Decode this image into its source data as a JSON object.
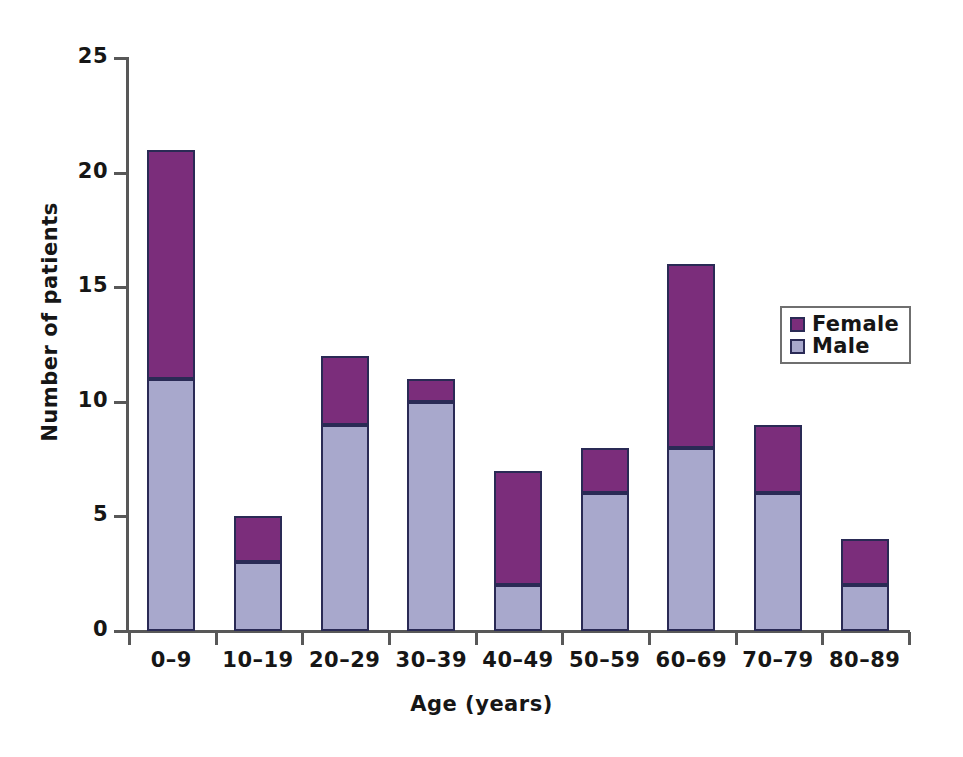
{
  "chart_data": {
    "type": "bar",
    "subtype": "stacked-vertical-bar",
    "title": "",
    "xlabel": "Age (years)",
    "ylabel": "Number of patients",
    "categories": [
      "0–9",
      "10–19",
      "20–29",
      "30–39",
      "40–49",
      "50–59",
      "60–69",
      "70–79",
      "80–89"
    ],
    "series": [
      {
        "name": "Male",
        "color": "#a8a8cc",
        "values": [
          11,
          3,
          9,
          10,
          2,
          6,
          8,
          6,
          2
        ]
      },
      {
        "name": "Female",
        "color": "#7b2d7b",
        "values": [
          10,
          2,
          3,
          1,
          5,
          2,
          8,
          3,
          2
        ]
      }
    ],
    "stack_order_bottom_to_top": [
      "Male",
      "Female"
    ],
    "totals": [
      21,
      5,
      12,
      11,
      7,
      8,
      16,
      9,
      4
    ],
    "ylim": [
      0,
      25
    ],
    "yticks": [
      0,
      5,
      10,
      15,
      20,
      25
    ],
    "ytick_labels": [
      "0",
      "5",
      "10",
      "15",
      "20",
      "25"
    ],
    "grid": false,
    "legend_position": "upper-right-inside"
  },
  "legend": {
    "entries": [
      {
        "label": "Female",
        "color": "#7b2d7b"
      },
      {
        "label": "Male",
        "color": "#a8a8cc"
      }
    ]
  },
  "colors": {
    "female": "#7b2d7b",
    "male": "#a8a8cc",
    "bar_border": "#2a2a55",
    "axis": "#585858",
    "text": "#161616",
    "background": "#ffffff"
  }
}
